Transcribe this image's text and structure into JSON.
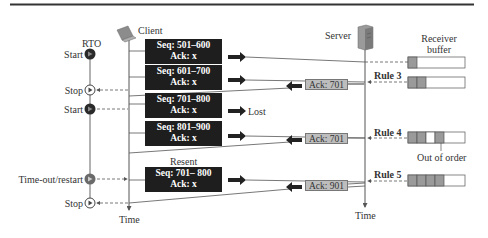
{
  "diagram": {
    "rto_label": "RTO",
    "client_label": "Client",
    "server_label": "Server",
    "receiver_buffer_label": "Receiver buffer",
    "receiver_buffer_lines": [
      "Receiver",
      "buffer"
    ],
    "time_label_client": "Time",
    "time_label_server": "Time",
    "timer_events": [
      {
        "label": "Start",
        "state": "filled"
      },
      {
        "label": "Stop",
        "state": "open"
      },
      {
        "label": "Start",
        "state": "filled"
      },
      {
        "label": "Time-out/restart",
        "state": "grey"
      },
      {
        "label": "Stop",
        "state": "open"
      }
    ],
    "segments": [
      {
        "seq": "Seq: 501–600",
        "ack": "Ack: x",
        "note": ""
      },
      {
        "seq": "Seq: 601–700",
        "ack": "Ack: x",
        "note": ""
      },
      {
        "seq": "Seq: 701–800",
        "ack": "Ack: x",
        "note": "Lost"
      },
      {
        "seq": "Seq: 801–900",
        "ack": "Ack: x",
        "note": ""
      },
      {
        "seq": "Seq: 701– 800",
        "ack": "Ack: x",
        "note": "",
        "above_label": "Resent"
      }
    ],
    "acks": [
      {
        "label": "Ack: 701",
        "rule": "Rule 3"
      },
      {
        "label": "Ack: 701",
        "rule": "Rule 4"
      },
      {
        "label": "Ack: 901",
        "rule": "Rule 5"
      }
    ],
    "buffer_states": [
      {
        "filled": [
          1,
          0,
          0,
          0,
          0
        ]
      },
      {
        "filled": [
          1,
          1,
          0,
          0,
          0
        ]
      },
      {
        "filled": [
          1,
          1,
          0,
          1,
          0
        ],
        "annotation": "Out of order"
      },
      {
        "filled": [
          1,
          1,
          1,
          1,
          0
        ]
      }
    ],
    "colors": {
      "segment_box": "#1e1e1e",
      "ack_box": "#bdbdbd",
      "buffer_filled": "#9a9a9a",
      "line": "#555555"
    }
  }
}
